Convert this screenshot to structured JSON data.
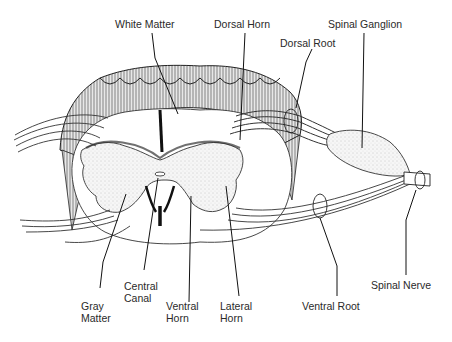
{
  "labels": {
    "white_matter": "White Matter",
    "dorsal_horn": "Dorsal Horn",
    "dorsal_root": "Dorsal Root",
    "spinal_ganglion": "Spinal Ganglion",
    "gray_matter": [
      "Gray",
      "Matter"
    ],
    "central_canal": [
      "Central",
      "Canal"
    ],
    "ventral_horn": [
      "Ventral",
      "Horn"
    ],
    "lateral_horn": [
      "Lateral",
      "Horn"
    ],
    "ventral_root": "Ventral Root",
    "spinal_nerve": "Spinal Nerve"
  }
}
